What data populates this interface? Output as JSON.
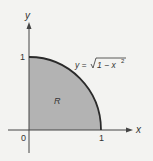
{
  "diagram": {
    "axes": {
      "x_label": "x",
      "y_label": "y",
      "origin_label": "0",
      "x_tick_label": "1",
      "y_tick_label": "1"
    },
    "region_label": "R",
    "curve_label": {
      "lhs": "y =",
      "radicand": "1 − x",
      "exponent": "2"
    },
    "colors": {
      "background": "#f3f3f1",
      "region_fill": "#b3b3b3",
      "curve": "#2a2a2a",
      "axis": "#444444"
    }
  }
}
